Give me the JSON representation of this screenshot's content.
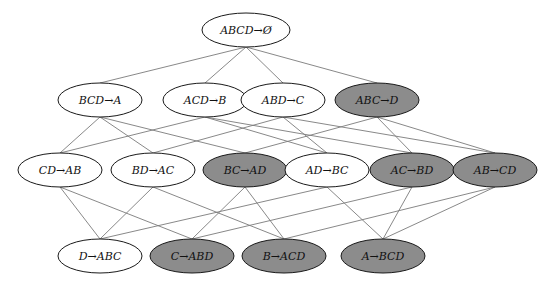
{
  "diagram": {
    "type": "lattice",
    "colors": {
      "highlighted_fill": "#8c8c8c",
      "plain_fill": "#ffffff",
      "border": "#1a1a1a",
      "edge": "#7a7a7a"
    },
    "nodes": [
      {
        "id": "ABCD",
        "label": "ABCD→Ø",
        "x": 246,
        "y": 30,
        "rx": 44,
        "ry": 17,
        "highlighted": false
      },
      {
        "id": "BCD",
        "label": "BCD→A",
        "x": 100,
        "y": 100,
        "rx": 42,
        "ry": 17,
        "highlighted": false
      },
      {
        "id": "ACD",
        "label": "ACD→B",
        "x": 205,
        "y": 100,
        "rx": 42,
        "ry": 17,
        "highlighted": false
      },
      {
        "id": "ABD",
        "label": "ABD→C",
        "x": 283,
        "y": 100,
        "rx": 42,
        "ry": 17,
        "highlighted": false
      },
      {
        "id": "ABC",
        "label": "ABC→D",
        "x": 377,
        "y": 100,
        "rx": 42,
        "ry": 17,
        "highlighted": true
      },
      {
        "id": "CD",
        "label": "CD→AB",
        "x": 60,
        "y": 170,
        "rx": 42,
        "ry": 17,
        "highlighted": false
      },
      {
        "id": "BD",
        "label": "BD→AC",
        "x": 153,
        "y": 170,
        "rx": 42,
        "ry": 17,
        "highlighted": false
      },
      {
        "id": "BC",
        "label": "BC→AD",
        "x": 245,
        "y": 170,
        "rx": 42,
        "ry": 17,
        "highlighted": true
      },
      {
        "id": "AD",
        "label": "AD→BC",
        "x": 327,
        "y": 170,
        "rx": 42,
        "ry": 17,
        "highlighted": false
      },
      {
        "id": "AC",
        "label": "AC→BD",
        "x": 412,
        "y": 170,
        "rx": 42,
        "ry": 17,
        "highlighted": true
      },
      {
        "id": "AB",
        "label": "AB→CD",
        "x": 495,
        "y": 170,
        "rx": 42,
        "ry": 17,
        "highlighted": true
      },
      {
        "id": "D",
        "label": "D→ABC",
        "x": 100,
        "y": 256,
        "rx": 42,
        "ry": 17,
        "highlighted": false
      },
      {
        "id": "C",
        "label": "C→ABD",
        "x": 192,
        "y": 256,
        "rx": 42,
        "ry": 17,
        "highlighted": true
      },
      {
        "id": "B",
        "label": "B→ACD",
        "x": 284,
        "y": 256,
        "rx": 42,
        "ry": 17,
        "highlighted": true
      },
      {
        "id": "A",
        "label": "A→BCD",
        "x": 383,
        "y": 256,
        "rx": 42,
        "ry": 17,
        "highlighted": true
      }
    ],
    "edges": [
      [
        "ABCD",
        "BCD"
      ],
      [
        "ABCD",
        "ACD"
      ],
      [
        "ABCD",
        "ABD"
      ],
      [
        "ABCD",
        "ABC"
      ],
      [
        "BCD",
        "CD"
      ],
      [
        "BCD",
        "BD"
      ],
      [
        "BCD",
        "BC"
      ],
      [
        "ACD",
        "CD"
      ],
      [
        "ACD",
        "AD"
      ],
      [
        "ACD",
        "AC"
      ],
      [
        "ABD",
        "BD"
      ],
      [
        "ABD",
        "AD"
      ],
      [
        "ABD",
        "AB"
      ],
      [
        "ABC",
        "BC"
      ],
      [
        "ABC",
        "AC"
      ],
      [
        "ABC",
        "AB"
      ],
      [
        "CD",
        "D"
      ],
      [
        "CD",
        "C"
      ],
      [
        "BD",
        "D"
      ],
      [
        "BD",
        "B"
      ],
      [
        "BC",
        "C"
      ],
      [
        "BC",
        "B"
      ],
      [
        "AD",
        "D"
      ],
      [
        "AD",
        "A"
      ],
      [
        "AC",
        "C"
      ],
      [
        "AC",
        "A"
      ],
      [
        "AB",
        "B"
      ],
      [
        "AB",
        "A"
      ]
    ]
  }
}
